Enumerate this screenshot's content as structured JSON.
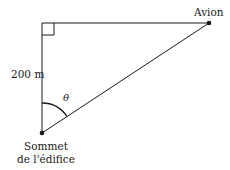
{
  "diagram": {
    "labels": {
      "plane": "Avion",
      "height": "200 m",
      "angle": "θ",
      "summit_line1": "Sommet",
      "summit_line2": "de l'édifice"
    },
    "points": {
      "corner": [
        42,
        23
      ],
      "plane": [
        209,
        23
      ],
      "summit": [
        42,
        133
      ]
    },
    "colors": {
      "stroke": "#1a1a1a",
      "background": "#ffffff"
    }
  }
}
